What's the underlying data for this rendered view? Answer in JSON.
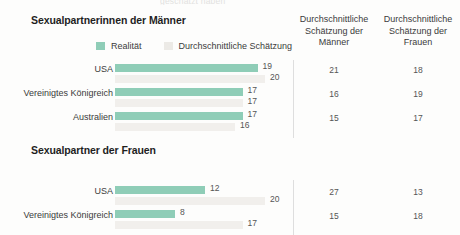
{
  "cut_title_fragment": "geschätzt haben",
  "legend": {
    "reality_label": "Realität",
    "estimate_label": "Durchschnittliche Schätzung",
    "reality_color": "#8fcdb7",
    "estimate_color": "#eceae6"
  },
  "columns": {
    "men_estimate_header": "Durchschnittliche Schätzung der Männer",
    "women_estimate_header": "Durchschnittliche Schätzung der Frauen"
  },
  "sections": [
    {
      "title": "Sexualpartnerinnen der Männer",
      "rows": [
        {
          "label": "USA",
          "reality": 19,
          "estimate": 20,
          "men_estimate": 21,
          "women_estimate": 18
        },
        {
          "label": "Vereinigtes Königreich",
          "reality": 17,
          "estimate": 17,
          "men_estimate": 16,
          "women_estimate": 19
        },
        {
          "label": "Australien",
          "reality": 17,
          "estimate": 16,
          "men_estimate": 15,
          "women_estimate": 17
        }
      ]
    },
    {
      "title": "Sexualpartner der Frauen",
      "rows": [
        {
          "label": "USA",
          "reality": 12,
          "estimate": 20,
          "men_estimate": 27,
          "women_estimate": 13
        },
        {
          "label": "Vereinigtes Königreich",
          "reality": 8,
          "estimate": 17,
          "men_estimate": 15,
          "women_estimate": 18
        }
      ]
    }
  ],
  "chart_data": {
    "type": "bar",
    "xlabel": "",
    "ylabel": "",
    "xlim": [
      0,
      20
    ],
    "grid": false,
    "legend_position": "top-left",
    "orientation": "horizontal",
    "panels": [
      {
        "title": "Sexualpartnerinnen der Männer",
        "categories": [
          "USA",
          "Vereinigtes Königreich",
          "Australien"
        ],
        "series": [
          {
            "name": "Realität",
            "values": [
              19,
              17,
              17
            ],
            "color": "#8fcdb7"
          },
          {
            "name": "Durchschnittliche Schätzung",
            "values": [
              20,
              17,
              16
            ],
            "color": "#f1efec"
          }
        ],
        "table_columns": [
          {
            "name": "Durchschnittliche Schätzung der Männer",
            "values": [
              21,
              16,
              15
            ]
          },
          {
            "name": "Durchschnittliche Schätzung der Frauen",
            "values": [
              18,
              19,
              17
            ]
          }
        ]
      },
      {
        "title": "Sexualpartner der Frauen",
        "categories": [
          "USA",
          "Vereinigtes Königreich"
        ],
        "series": [
          {
            "name": "Realität",
            "values": [
              12,
              8
            ],
            "color": "#8fcdb7"
          },
          {
            "name": "Durchschnittliche Schätzung",
            "values": [
              20,
              17
            ],
            "color": "#f1efec"
          }
        ],
        "table_columns": [
          {
            "name": "Durchschnittliche Schätzung der Männer",
            "values": [
              27,
              15
            ]
          },
          {
            "name": "Durchschnittliche Schätzung der Frauen",
            "values": [
              13,
              18
            ]
          }
        ]
      }
    ]
  }
}
